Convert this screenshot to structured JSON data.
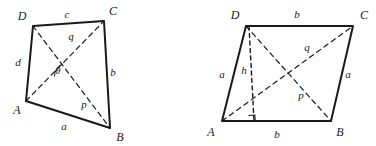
{
  "diagram": {
    "type": "geometry-quadrilateral-diagram",
    "stroke_color": "#1a1a1a",
    "background_color": "#ffffff",
    "figures": [
      {
        "name": "general-quadrilateral",
        "vertices": [
          {
            "label": "A",
            "x": 26,
            "y": 101,
            "label_x": 17,
            "label_y": 110
          },
          {
            "label": "B",
            "x": 110,
            "y": 128,
            "label_x": 120,
            "label_y": 137
          },
          {
            "label": "C",
            "x": 104,
            "y": 21,
            "label_x": 113,
            "label_y": 11
          },
          {
            "label": "D",
            "x": 33,
            "y": 26,
            "label_x": 22,
            "label_y": 16
          }
        ],
        "sides": [
          {
            "label": "a",
            "from": "A",
            "to": "B",
            "label_x": 64,
            "label_y": 126
          },
          {
            "label": "b",
            "from": "B",
            "to": "C",
            "label_x": 113,
            "label_y": 72
          },
          {
            "label": "c",
            "from": "C",
            "to": "D",
            "label_x": 67,
            "label_y": 14
          },
          {
            "label": "d",
            "from": "D",
            "to": "A",
            "label_x": 18,
            "label_y": 62
          }
        ],
        "diagonals": [
          {
            "label": "p",
            "from": "A",
            "to": "C",
            "label_x": 84,
            "label_y": 104
          },
          {
            "label": "q",
            "from": "D",
            "to": "B",
            "label_x": 71,
            "label_y": 36
          }
        ],
        "angle": {
          "label": "θ",
          "label_x": 58,
          "label_y": 71
        }
      },
      {
        "name": "parallelogram",
        "vertices": [
          {
            "label": "A",
            "x": 222,
            "y": 121,
            "label_x": 211,
            "label_y": 132
          },
          {
            "label": "B",
            "x": 331,
            "y": 121,
            "label_x": 340,
            "label_y": 132
          },
          {
            "label": "C",
            "x": 353,
            "y": 26,
            "label_x": 364,
            "label_y": 15
          },
          {
            "label": "D",
            "x": 246,
            "y": 26,
            "label_x": 235,
            "label_y": 15
          }
        ],
        "sides": [
          {
            "label": "b",
            "from": "A",
            "to": "B",
            "label_x": 277,
            "label_y": 134
          },
          {
            "label": "a",
            "from": "B",
            "to": "C",
            "label_x": 348,
            "label_y": 74
          },
          {
            "label": "b",
            "from": "C",
            "to": "D",
            "label_x": 297,
            "label_y": 14
          },
          {
            "label": "a",
            "from": "D",
            "to": "A",
            "label_x": 222,
            "label_y": 74
          }
        ],
        "diagonals": [
          {
            "label": "p",
            "from": "D",
            "to": "B",
            "label_x": 301,
            "label_y": 95
          },
          {
            "label": "q",
            "from": "A",
            "to": "C",
            "label_x": 307,
            "label_y": 47
          }
        ],
        "height": {
          "label": "h",
          "from_x": 246,
          "from_y": 26,
          "to_x": 254,
          "to_y": 121,
          "label_x": 244,
          "label_y": 70,
          "right_angle_marker": true
        }
      }
    ]
  }
}
